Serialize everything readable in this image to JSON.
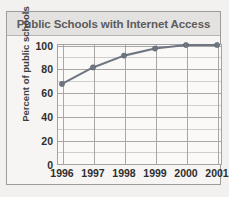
{
  "chart_data": {
    "type": "line",
    "title": "Public Schools with Internet Access",
    "xlabel": "",
    "ylabel": "Percent of public schools",
    "categories": [
      "1996",
      "1997",
      "1998",
      "1999",
      "2000",
      "2001"
    ],
    "values": [
      67,
      81,
      91,
      97,
      100,
      100
    ],
    "series": [
      {
        "name": "Percent of public schools with Internet access",
        "values": [
          67,
          81,
          91,
          97,
          100,
          100
        ]
      }
    ],
    "ylim": [
      0,
      100
    ],
    "yticks": [
      0,
      20,
      40,
      60,
      80,
      100
    ],
    "ytick_labels": [
      "0",
      "20",
      "40",
      "60",
      "80",
      "100"
    ],
    "minor_gridline_step": 10,
    "grid": true,
    "legend": "none",
    "line_color": "#6f7682",
    "marker_color": "#6f7682",
    "title_bar_color": "#e3e2e0",
    "plot_background": "#faf9f8",
    "page_background": "#f2f1ef"
  }
}
